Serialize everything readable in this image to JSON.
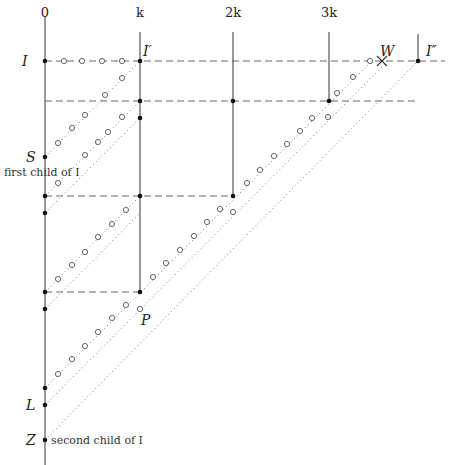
{
  "columns": [
    {
      "id": "col-0",
      "label": "0",
      "x": 45,
      "top": 17,
      "bottom": 465
    },
    {
      "id": "col-k",
      "label": "k",
      "x": 140,
      "top": 32,
      "bottom": 292
    },
    {
      "id": "col-2k",
      "label": "2k",
      "x": 233,
      "top": 32,
      "bottom": 196
    },
    {
      "id": "col-3k",
      "label": "3k",
      "x": 329,
      "top": 32,
      "bottom": 101
    },
    {
      "id": "col-I2",
      "label": "",
      "x": 418,
      "top": 34,
      "bottom": 61
    }
  ],
  "column_label_y": 17,
  "labels": {
    "I": "I",
    "I_prime": "I′",
    "I_double_prime": "I″",
    "W": "W",
    "S": "S",
    "first_child": "first child of I",
    "P": "P",
    "L": "L",
    "Z": "Z",
    "second_child": "second child of I"
  },
  "dashed_lines": [
    {
      "y": 61,
      "x1": 45,
      "x2": 445
    },
    {
      "y": 101,
      "x1": 45,
      "x2": 415
    },
    {
      "y": 196,
      "x1": 45,
      "x2": 233
    },
    {
      "y": 292,
      "x1": 45,
      "x2": 140
    }
  ],
  "dots": [
    {
      "x": 45,
      "y": 61
    },
    {
      "x": 140,
      "y": 61
    },
    {
      "x": 418,
      "y": 61
    },
    {
      "x": 140,
      "y": 101
    },
    {
      "x": 233,
      "y": 101
    },
    {
      "x": 329,
      "y": 101
    },
    {
      "x": 140,
      "y": 118
    },
    {
      "x": 45,
      "y": 157
    },
    {
      "x": 45,
      "y": 196
    },
    {
      "x": 140,
      "y": 196
    },
    {
      "x": 233,
      "y": 196
    },
    {
      "x": 45,
      "y": 213
    },
    {
      "x": 45,
      "y": 292
    },
    {
      "x": 140,
      "y": 292
    },
    {
      "x": 45,
      "y": 309
    },
    {
      "x": 45,
      "y": 388
    },
    {
      "x": 45,
      "y": 405
    },
    {
      "x": 45,
      "y": 440
    }
  ],
  "dotted_lines": [
    {
      "x1": 45,
      "y1": 157,
      "x2": 140,
      "y2": 61
    },
    {
      "x1": 45,
      "y1": 196,
      "x2": 140,
      "y2": 101
    },
    {
      "x1": 45,
      "y1": 213,
      "x2": 140,
      "y2": 118
    },
    {
      "x1": 45,
      "y1": 292,
      "x2": 140,
      "y2": 196
    },
    {
      "x1": 45,
      "y1": 309,
      "x2": 140,
      "y2": 213
    },
    {
      "x1": 45,
      "y1": 388,
      "x2": 372,
      "y2": 61
    },
    {
      "x1": 45,
      "y1": 405,
      "x2": 388,
      "y2": 61
    },
    {
      "x1": 45,
      "y1": 440,
      "x2": 418,
      "y2": 61
    }
  ],
  "circles": [
    {
      "x": 64,
      "y": 61
    },
    {
      "x": 82,
      "y": 61
    },
    {
      "x": 102,
      "y": 61
    },
    {
      "x": 122,
      "y": 61
    },
    {
      "x": 122,
      "y": 78
    },
    {
      "x": 105,
      "y": 95
    },
    {
      "x": 85,
      "y": 115
    },
    {
      "x": 72,
      "y": 128
    },
    {
      "x": 58,
      "y": 143
    },
    {
      "x": 122,
      "y": 117
    },
    {
      "x": 108,
      "y": 132
    },
    {
      "x": 98,
      "y": 142
    },
    {
      "x": 85,
      "y": 155
    },
    {
      "x": 58,
      "y": 183
    },
    {
      "x": 126,
      "y": 210
    },
    {
      "x": 112,
      "y": 224
    },
    {
      "x": 98,
      "y": 237
    },
    {
      "x": 85,
      "y": 252
    },
    {
      "x": 72,
      "y": 265
    },
    {
      "x": 58,
      "y": 279
    },
    {
      "x": 126,
      "y": 305
    },
    {
      "x": 112,
      "y": 318
    },
    {
      "x": 98,
      "y": 332
    },
    {
      "x": 85,
      "y": 346
    },
    {
      "x": 72,
      "y": 359
    },
    {
      "x": 58,
      "y": 374
    },
    {
      "x": 312,
      "y": 118
    },
    {
      "x": 300,
      "y": 131
    },
    {
      "x": 287,
      "y": 144
    },
    {
      "x": 274,
      "y": 156
    },
    {
      "x": 260,
      "y": 170
    },
    {
      "x": 247,
      "y": 183
    },
    {
      "x": 220,
      "y": 209
    },
    {
      "x": 207,
      "y": 222
    },
    {
      "x": 194,
      "y": 236
    },
    {
      "x": 180,
      "y": 250
    },
    {
      "x": 166,
      "y": 263
    },
    {
      "x": 153,
      "y": 277
    },
    {
      "x": 370,
      "y": 61
    },
    {
      "x": 353,
      "y": 77
    },
    {
      "x": 337,
      "y": 93
    },
    {
      "x": 233,
      "y": 212
    },
    {
      "x": 328,
      "y": 117
    },
    {
      "x": 140,
      "y": 309
    }
  ],
  "cross": {
    "x": 382,
    "y": 61
  }
}
